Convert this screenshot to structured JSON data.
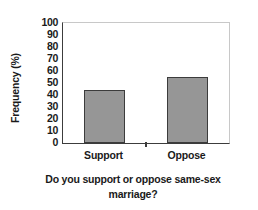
{
  "chart_data": {
    "type": "bar",
    "title": "",
    "subtitle": "",
    "categories": [
      "Support",
      "Oppose"
    ],
    "values": [
      44,
      55
    ],
    "series": [
      {
        "name": "Frequency (%)",
        "values": [
          44,
          55
        ]
      }
    ],
    "xlabel": "Do you support or oppose same-sex marriage?",
    "xlabel_line1": "Do you support or oppose same-sex",
    "xlabel_line2": "marriage?",
    "ylabel": "Frequency (%)",
    "ylim": [
      0,
      100
    ],
    "ytick_step": 10,
    "yticks": [
      "100",
      "90",
      "80",
      "70",
      "60",
      "50",
      "40",
      "30",
      "20",
      "10",
      "0"
    ],
    "grid": false,
    "legend": false,
    "legend_position": "none",
    "colors": {
      "bar_fill": "#969696",
      "bar_edge": "#3c3c3c",
      "axis": "#3c3c3c",
      "plot_frame_light": "#c8c8c8",
      "background": "#ffffff",
      "text": "#1a1a1a"
    }
  }
}
